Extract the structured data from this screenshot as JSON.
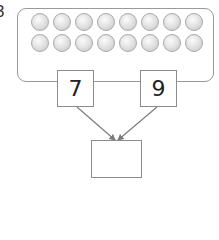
{
  "question": {
    "number": "3"
  },
  "counters": {
    "rows": 2,
    "per_row": 8,
    "total": 16,
    "color": "#d4d4d4"
  },
  "part_whole": {
    "part_a": "7",
    "part_b": "9",
    "whole": ""
  },
  "colors": {
    "stroke": "#8c8c8c",
    "arrow": "#7a7a7a"
  }
}
